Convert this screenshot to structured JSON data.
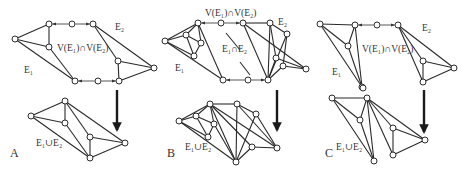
{
  "figure": {
    "panels": [
      {
        "id": "A",
        "label": "A",
        "label_pos": [
          10,
          157
        ],
        "top": {
          "labels": [
            {
              "text": "E₁",
              "pos": [
                24,
                73
              ],
              "name": "e1-label"
            },
            {
              "text": "E₂",
              "pos": [
                115,
                30
              ],
              "name": "e2-label"
            },
            {
              "text": "V(E₁)∩V(E₂)",
              "pos": [
                57,
                51
              ],
              "name": "intersection-label"
            }
          ],
          "nodes": [
            [
              15,
              39
            ],
            [
              49,
              24
            ],
            [
              49,
              47
            ],
            [
              75,
              81
            ],
            [
              72,
              24
            ],
            [
              93,
              24
            ],
            [
              118,
              61
            ],
            [
              154,
              68
            ],
            [
              98,
              81
            ],
            [
              119,
              81
            ]
          ],
          "edges": [
            [
              0,
              1
            ],
            [
              0,
              2
            ],
            [
              0,
              3
            ],
            [
              1,
              2
            ],
            [
              2,
              3
            ],
            [
              5,
              6
            ],
            [
              5,
              7
            ],
            [
              6,
              7
            ],
            [
              6,
              9
            ],
            [
              9,
              7
            ]
          ],
          "links": [
            [
              4,
              1
            ],
            [
              4,
              5
            ],
            [
              8,
              3
            ],
            [
              8,
              9
            ]
          ]
        },
        "arrow": {
          "x": 117,
          "y1": 90,
          "y2": 130
        },
        "bottom": {
          "labels": [
            {
              "text": "E₁∪E₂",
              "pos": [
                36,
                146
              ],
              "name": "union-label"
            }
          ],
          "nodes": [
            [
              31,
              116
            ],
            [
              65,
              101
            ],
            [
              65,
              123
            ],
            [
              90,
              137
            ],
            [
              90,
              158
            ],
            [
              125,
              143
            ]
          ],
          "edges": [
            [
              0,
              1
            ],
            [
              0,
              2
            ],
            [
              0,
              4
            ],
            [
              1,
              2
            ],
            [
              1,
              3
            ],
            [
              1,
              5
            ],
            [
              2,
              4
            ],
            [
              3,
              4
            ],
            [
              3,
              5
            ],
            [
              4,
              5
            ]
          ]
        }
      },
      {
        "id": "B",
        "label": "B",
        "label_pos": [
          167,
          157
        ],
        "top": {
          "labels": [
            {
              "text": "E₁",
              "pos": [
                175,
                71
              ],
              "name": "e1-label"
            },
            {
              "text": "E₂",
              "pos": [
                278,
                25
              ],
              "name": "e2-label"
            },
            {
              "text": "V(E₁)∩V(E₂)",
              "pos": [
                205,
                16
              ],
              "name": "intersection-label"
            },
            {
              "text": "E₁∩E₂",
              "pos": [
                222,
                52
              ],
              "name": "edge-intersection-label"
            }
          ],
          "nodes": [
            [
              165,
              41
            ],
            [
              198,
              23
            ],
            [
              186,
              35
            ],
            [
              201,
              43
            ],
            [
              194,
              56
            ],
            [
              223,
              80
            ],
            [
              221,
              23
            ],
            [
              243,
              23
            ],
            [
              270,
              23
            ],
            [
              287,
              34
            ],
            [
              276,
              58
            ],
            [
              283,
              66
            ],
            [
              306,
              69
            ],
            [
              248,
              80
            ],
            [
              268,
              80
            ]
          ],
          "edges": [
            [
              0,
              1
            ],
            [
              0,
              2
            ],
            [
              0,
              4
            ],
            [
              0,
              5
            ],
            [
              1,
              2
            ],
            [
              1,
              5
            ],
            [
              2,
              3
            ],
            [
              2,
              4
            ],
            [
              3,
              4
            ],
            [
              1,
              3
            ],
            [
              7,
              8
            ],
            [
              7,
              12
            ],
            [
              7,
              14
            ],
            [
              8,
              9
            ],
            [
              8,
              10
            ],
            [
              9,
              11
            ],
            [
              9,
              14
            ],
            [
              10,
              12
            ],
            [
              11,
              12
            ],
            [
              10,
              14
            ],
            [
              11,
              14
            ],
            [
              8,
              14
            ]
          ],
          "links": [
            [
              6,
              1
            ],
            [
              6,
              7
            ],
            [
              13,
              5
            ],
            [
              13,
              14
            ]
          ],
          "diag": [
            [
              226,
              33
            ],
            [
              240,
              50
            ]
          ],
          "diag2": [
            [
              240,
              62
            ],
            [
              250,
              75
            ]
          ]
        },
        "arrow": {
          "x": 277,
          "y1": 90,
          "y2": 130
        },
        "bottom": {
          "labels": [
            {
              "text": "E₁∪E₂",
              "pos": [
                185,
                150
              ],
              "name": "union-label"
            }
          ],
          "nodes": [
            [
              179,
              121
            ],
            [
              210,
              104
            ],
            [
              196,
              116
            ],
            [
              214,
              124
            ],
            [
              208,
              137
            ],
            [
              236,
              162
            ],
            [
              237,
              104
            ],
            [
              256,
              114
            ],
            [
              252,
              147
            ],
            [
              277,
              148
            ]
          ],
          "edges": [
            [
              0,
              1
            ],
            [
              0,
              2
            ],
            [
              0,
              4
            ],
            [
              0,
              5
            ],
            [
              1,
              2
            ],
            [
              1,
              5
            ],
            [
              2,
              3
            ],
            [
              2,
              4
            ],
            [
              3,
              4
            ],
            [
              1,
              3
            ],
            [
              1,
              6
            ],
            [
              1,
              8
            ],
            [
              1,
              9
            ],
            [
              6,
              7
            ],
            [
              6,
              9
            ],
            [
              6,
              5
            ],
            [
              7,
              5
            ],
            [
              7,
              9
            ],
            [
              8,
              9
            ],
            [
              8,
              5
            ],
            [
              3,
              5
            ]
          ]
        }
      },
      {
        "id": "C",
        "label": "C",
        "label_pos": [
          325,
          157
        ],
        "top": {
          "labels": [
            {
              "text": "E₁",
              "pos": [
                332,
                75
              ],
              "name": "e1-label"
            },
            {
              "text": "E₂",
              "pos": [
                422,
                31
              ],
              "name": "e2-label"
            },
            {
              "text": "V(E₁)∩V(E₂)",
              "pos": [
                362,
                52
              ],
              "name": "intersection-label"
            }
          ],
          "nodes": [
            [
              320,
              24
            ],
            [
              355,
              25
            ],
            [
              348,
              46
            ],
            [
              362,
              87
            ],
            [
              377,
              25
            ],
            [
              398,
              25
            ],
            [
              423,
              61
            ],
            [
              454,
              68
            ],
            [
              423,
              82
            ]
          ],
          "edges": [
            [
              0,
              1
            ],
            [
              0,
              2
            ],
            [
              0,
              3
            ],
            [
              1,
              2
            ],
            [
              1,
              3
            ],
            [
              2,
              3
            ],
            [
              5,
              6
            ],
            [
              5,
              7
            ],
            [
              5,
              8
            ],
            [
              6,
              7
            ],
            [
              6,
              8
            ],
            [
              8,
              7
            ]
          ],
          "links": [
            [
              4,
              1
            ],
            [
              4,
              5
            ]
          ]
        },
        "arrow": {
          "x": 424,
          "y1": 90,
          "y2": 132
        },
        "bottom": {
          "labels": [
            {
              "text": "E₁∪E₂",
              "pos": [
                336,
                150
              ],
              "name": "union-label"
            }
          ],
          "nodes": [
            [
              332,
              98
            ],
            [
              367,
              98
            ],
            [
              360,
              120
            ],
            [
              374,
              161
            ],
            [
              393,
              128
            ],
            [
              393,
              155
            ],
            [
              425,
              140
            ],
            [
              363,
              88
            ]
          ],
          "edges": [
            [
              0,
              1
            ],
            [
              0,
              2
            ],
            [
              0,
              3
            ],
            [
              1,
              2
            ],
            [
              1,
              3
            ],
            [
              2,
              3
            ],
            [
              1,
              4
            ],
            [
              1,
              5
            ],
            [
              1,
              6
            ],
            [
              4,
              6
            ],
            [
              4,
              5
            ],
            [
              5,
              6
            ]
          ]
        }
      }
    ]
  }
}
